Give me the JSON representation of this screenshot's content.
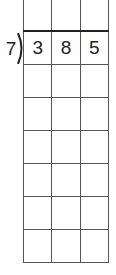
{
  "division": {
    "divisor": "7",
    "dividend_digits": [
      "3",
      "8",
      "5"
    ],
    "columns": 3,
    "rows_total": 8
  }
}
